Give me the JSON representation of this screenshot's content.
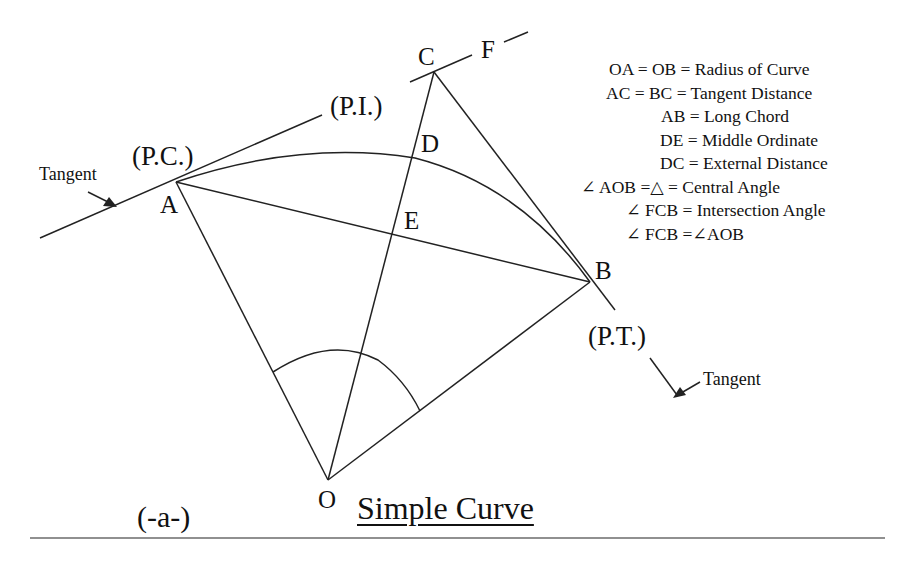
{
  "diagram": {
    "title": "Simple Curve",
    "figure_label": "(-a-)",
    "points": {
      "A": "A",
      "B": "B",
      "C": "C",
      "D": "D",
      "E": "E",
      "F": "F",
      "O": "O"
    },
    "annotations": {
      "pc": "(P.C.)",
      "pi": "(P.I.)",
      "pt": "(P.T.)",
      "tangent_left": "Tangent",
      "tangent_right": "Tangent"
    },
    "legend": [
      "OA = OB = Radius of Curve",
      "AC = BC = Tangent Distance",
      "AB = Long Chord",
      "DE = Middle Ordinate",
      "DC = External Distance",
      "∠ AOB =△ = Central Angle",
      "∠ FCB = Intersection Angle",
      "∠ FCB =∠AOB"
    ]
  }
}
